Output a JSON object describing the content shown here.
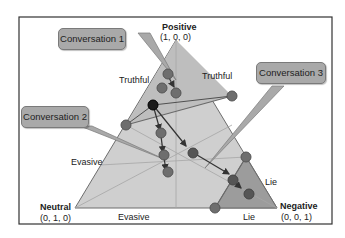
{
  "vertices": {
    "positive": {
      "name": "Positive",
      "coords": "(1, 0, 0)"
    },
    "neutral": {
      "name": "Neutral",
      "coords": "(0, 1, 0)"
    },
    "negative": {
      "name": "Negative",
      "coords": "(0, 0, 1)"
    }
  },
  "region_labels": {
    "truthful_left": "Truthful",
    "truthful_right": "Truthful",
    "evasive_left": "Evasive",
    "evasive_bottom": "Evasive",
    "lie_right": "Lie",
    "lie_bottom": "Lie"
  },
  "callouts": {
    "c1": "Conversation 1",
    "c2": "Conversation 2",
    "c3": "Conversation 3"
  },
  "colors": {
    "frame": "#333333",
    "triangle_fill": "#c8c8c8",
    "truthful_fill": "#bdbdbd",
    "lie_fill": "#9a9a9a",
    "point": "#6e6e6e",
    "point_dark": "#1a1a1a",
    "callout": "#a9a9a9"
  }
}
